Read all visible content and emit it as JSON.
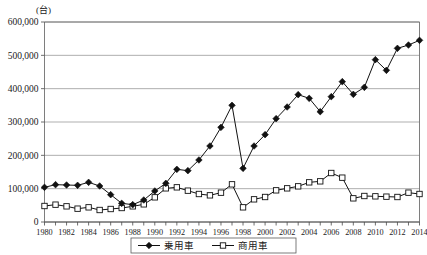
{
  "chart_data": {
    "type": "line",
    "title": "",
    "subtitle": "",
    "unit_label": "(台)",
    "xlabel": "",
    "ylabel": "",
    "ylim": [
      0,
      600000
    ],
    "xlim": [
      1980,
      2014
    ],
    "grid": true,
    "legend_position": "bottom",
    "ytick_labels": [
      "600,000",
      "500,000",
      "400,000",
      "300,000",
      "200,000",
      "100,000",
      "0"
    ],
    "ytick_values": [
      600000,
      500000,
      400000,
      300000,
      200000,
      100000,
      0
    ],
    "xtick_labels": [
      "1980",
      "1982",
      "1984",
      "1986",
      "1988",
      "1990",
      "1992",
      "1994",
      "1996",
      "1998",
      "2000",
      "2002",
      "2004",
      "2006",
      "2008",
      "2010",
      "2012",
      "2014"
    ],
    "x": [
      1980,
      1981,
      1982,
      1983,
      1984,
      1985,
      1986,
      1987,
      1988,
      1989,
      1990,
      1991,
      1992,
      1993,
      1994,
      1995,
      1996,
      1997,
      1998,
      1999,
      2000,
      2001,
      2002,
      2003,
      2004,
      2005,
      2006,
      2007,
      2008,
      2009,
      2010,
      2011,
      2012,
      2013,
      2014
    ],
    "series": [
      {
        "name": "乗用車",
        "marker": "filled-diamond",
        "values": [
          104000,
          112000,
          111000,
          110000,
          119000,
          108000,
          82000,
          56000,
          52000,
          66000,
          93000,
          116000,
          158000,
          154000,
          186000,
          228000,
          284000,
          350000,
          161000,
          228000,
          262000,
          310000,
          345000,
          382000,
          371000,
          331000,
          376000,
          421000,
          383000,
          404000,
          487000,
          455000,
          521000,
          531000,
          545000
        ]
      },
      {
        "name": "商用車",
        "marker": "open-square",
        "values": [
          48000,
          52000,
          47000,
          40000,
          44000,
          36000,
          39000,
          42000,
          47000,
          53000,
          74000,
          101000,
          104000,
          94000,
          84000,
          80000,
          88000,
          113000,
          44000,
          68000,
          75000,
          95000,
          101000,
          107000,
          119000,
          122000,
          147000,
          133000,
          71000,
          78000,
          77000,
          76000,
          75000,
          88000,
          84000
        ]
      }
    ]
  },
  "legend": {
    "items": [
      {
        "label": "乗用車",
        "marker": "filled-diamond"
      },
      {
        "label": "商用車",
        "marker": "open-square"
      }
    ]
  }
}
